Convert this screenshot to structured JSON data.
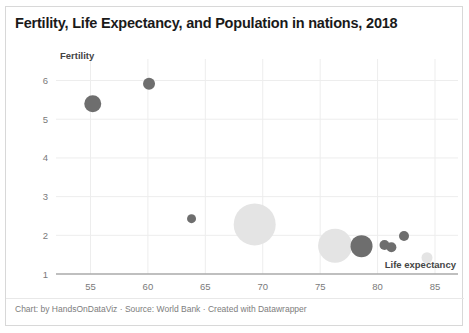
{
  "chart_data": {
    "type": "scatter",
    "title": "Fertility, Life Expectancy, and Population in nations, 2018",
    "xlabel": "Life expectancy",
    "ylabel": "Fertility",
    "xlim": [
      52.0,
      87.0
    ],
    "ylim": [
      1.0,
      6.35
    ],
    "xticks": [
      55,
      60,
      65,
      70,
      75,
      80,
      85
    ],
    "yticks": [
      1,
      2,
      3,
      4,
      5,
      6
    ],
    "grid": true,
    "legend": "none",
    "size_encodes": "Population",
    "colors": {
      "bubble_dark": "#6e6e6e",
      "bubble_light": "#e4e4e4",
      "grid": "#ededed",
      "axis": "#888888",
      "title_text": "#1a1a1a",
      "tick_text": "#7a7a7a",
      "footer_text": "#7d7d7d"
    },
    "points": [
      {
        "x": 55.2,
        "y": 5.4,
        "r": 8.5,
        "shade": "dark"
      },
      {
        "x": 60.1,
        "y": 5.92,
        "r": 6.0,
        "shade": "dark"
      },
      {
        "x": 63.8,
        "y": 2.43,
        "r": 4.5,
        "shade": "dark"
      },
      {
        "x": 69.3,
        "y": 2.28,
        "r": 21.0,
        "shade": "light"
      },
      {
        "x": 76.3,
        "y": 1.73,
        "r": 17.0,
        "shade": "light"
      },
      {
        "x": 78.6,
        "y": 1.72,
        "r": 11.0,
        "shade": "dark"
      },
      {
        "x": 80.6,
        "y": 1.75,
        "r": 5.0,
        "shade": "dark"
      },
      {
        "x": 81.2,
        "y": 1.69,
        "r": 5.0,
        "shade": "dark"
      },
      {
        "x": 82.3,
        "y": 1.98,
        "r": 5.0,
        "shade": "dark"
      },
      {
        "x": 84.3,
        "y": 1.42,
        "r": 5.5,
        "shade": "light"
      }
    ]
  },
  "footer": {
    "credit": "Chart: by HandsOnDataViz · Source: World Bank · Created with Datawrapper"
  }
}
